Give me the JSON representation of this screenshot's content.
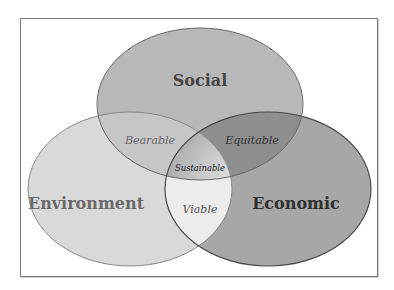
{
  "diagram": {
    "type": "venn",
    "sets": [
      {
        "id": "social",
        "label": "Social",
        "fill": "#b8b8b8",
        "text_color": "#454545"
      },
      {
        "id": "environment",
        "label": "Environment",
        "fill": "#d9d9d9",
        "text_color": "#6a6a6a"
      },
      {
        "id": "economic",
        "label": "Economic",
        "fill": "#a7a7a7",
        "text_color": "#303030"
      }
    ],
    "intersections": [
      {
        "id": "bearable",
        "sets": [
          "social",
          "environment"
        ],
        "label": "Bearable",
        "fill": "#c6c6c6",
        "text_color": "#666666"
      },
      {
        "id": "equitable",
        "sets": [
          "social",
          "economic"
        ],
        "label": "Equitable",
        "fill": "#8e8e8e",
        "text_color": "#333333"
      },
      {
        "id": "viable",
        "sets": [
          "environment",
          "economic"
        ],
        "label": "Viable",
        "fill": "#ececec",
        "text_color": "#555555"
      },
      {
        "id": "sustainable",
        "sets": [
          "social",
          "environment",
          "economic"
        ],
        "label": "Sustainable",
        "fill": "#bdbdbd",
        "text_color": "#222222"
      }
    ],
    "outline_color": "#5a5a5a"
  }
}
